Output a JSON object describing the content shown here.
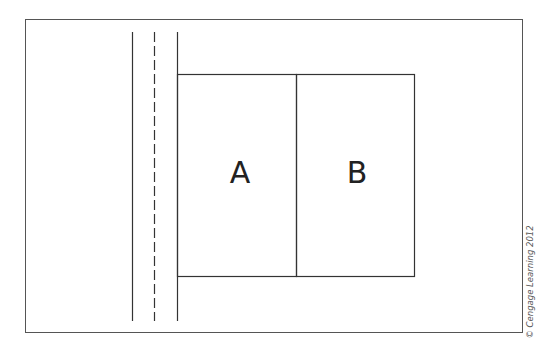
{
  "diagram": {
    "lots": [
      {
        "label": "A"
      },
      {
        "label": "B"
      }
    ],
    "credit": "© Cengage Learning 2012",
    "colors": {
      "stroke": "#333333",
      "background": "#ffffff"
    }
  }
}
